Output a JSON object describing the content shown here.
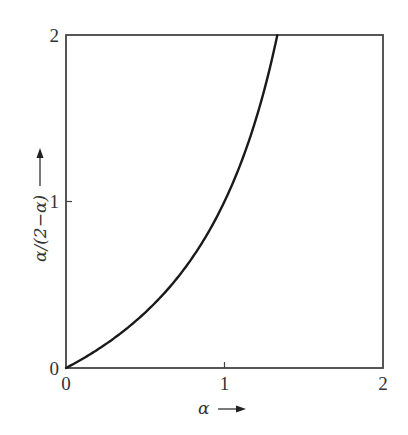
{
  "chart_data": {
    "type": "line",
    "title": "",
    "xlabel": "α",
    "ylabel": "α/(2−α)",
    "xlim": [
      0,
      2
    ],
    "ylim": [
      0,
      2
    ],
    "xticks": [
      "0",
      "1",
      "2"
    ],
    "yticks": [
      "0",
      "1",
      "2"
    ],
    "grid": false,
    "legend": null,
    "series": [
      {
        "name": "α/(2−α)",
        "x": [
          0,
          0.1,
          0.2,
          0.3,
          0.4,
          0.5,
          0.6,
          0.7,
          0.8,
          0.9,
          1.0,
          1.1,
          1.2,
          1.3,
          1.333
        ],
        "y": [
          0,
          0.053,
          0.111,
          0.176,
          0.25,
          0.333,
          0.429,
          0.538,
          0.667,
          0.818,
          1.0,
          1.222,
          1.5,
          1.857,
          2.0
        ]
      }
    ]
  },
  "axes": {
    "x_label_text": "α",
    "x_arrow": "→",
    "y_label_text": "α/(2−α)",
    "y_arrow": "→",
    "x_tick_labels": [
      "0",
      "1",
      "2"
    ],
    "y_tick_labels": [
      "0",
      "1",
      "2"
    ]
  }
}
